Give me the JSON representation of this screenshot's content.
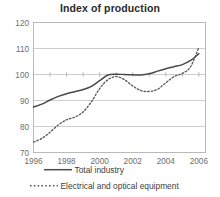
{
  "chart_data": {
    "type": "line",
    "title": "Index of production",
    "xlabel": "",
    "ylabel": "",
    "xlim": [
      1996,
      2006.4
    ],
    "ylim": [
      70,
      120
    ],
    "grid": true,
    "legend_position": "bottom",
    "xticks": [
      "1996",
      "1998",
      "2000",
      "2002",
      "2004",
      "2006"
    ],
    "xtick_values": [
      1996,
      1998,
      2000,
      2002,
      2004,
      2006
    ],
    "yticks": [
      "70",
      "80",
      "90",
      "100",
      "110",
      "120"
    ],
    "ytick_values": [
      70,
      80,
      90,
      100,
      110,
      120
    ],
    "x": [
      1996,
      1996.5,
      1997,
      1997.5,
      1998,
      1998.5,
      1999,
      1999.5,
      2000,
      2000.5,
      2001,
      2001.5,
      2002,
      2002.5,
      2003,
      2003.5,
      2004,
      2004.5,
      2005,
      2005.5,
      2006
    ],
    "series": [
      {
        "name": "Total industry",
        "style": "solid",
        "color": "#4a4a4a",
        "values": [
          87.5,
          88.6,
          90.2,
          91.6,
          92.6,
          93.4,
          94.2,
          95.4,
          97.6,
          99.8,
          100.1,
          100.0,
          99.9,
          99.8,
          100.3,
          101.3,
          102.2,
          103.0,
          103.8,
          105.4,
          108.0
        ]
      },
      {
        "name": "Electrical and optical equipment",
        "style": "dashed",
        "color": "#5a5a5a",
        "values": [
          74.0,
          75.4,
          77.8,
          80.6,
          82.6,
          83.6,
          85.6,
          89.5,
          94.6,
          98.0,
          99.2,
          98.0,
          95.6,
          93.8,
          93.5,
          94.3,
          96.8,
          99.2,
          100.4,
          103.0,
          110.5
        ]
      }
    ]
  },
  "legend": {
    "items": [
      {
        "label": "Total industry",
        "style": "solid"
      },
      {
        "label": "Electrical and optical equipment",
        "style": "dashed"
      }
    ]
  }
}
